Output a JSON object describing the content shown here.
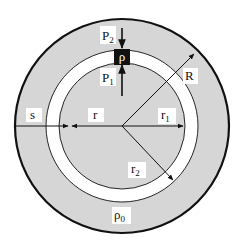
{
  "diagram": {
    "colors": {
      "background": "#ffffff",
      "shell_fill": "#d6d6d6",
      "ring_fill": "#ffffff",
      "stroke": "#111111",
      "element_fill": "#111111"
    },
    "labels": {
      "p2": "P",
      "p2_sub": "2",
      "p1": "P",
      "p1_sub": "1",
      "rho": "ρ",
      "R": "R",
      "s": "s",
      "r": "r",
      "r1": "r",
      "r1_sub": "1",
      "r2": "r",
      "r2_sub": "2",
      "rho0": "ρ",
      "rho0_sub": "0"
    }
  }
}
